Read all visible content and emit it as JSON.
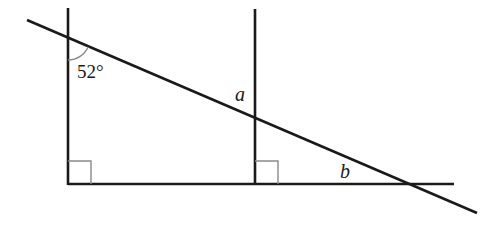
{
  "diagram": {
    "type": "geometry",
    "labels": {
      "given_angle": "52°",
      "angle_a": "a",
      "angle_b": "b"
    },
    "colors": {
      "line": "#1a1a1a",
      "right_angle_marker": "#8a8a8a",
      "angle_arc": "#8a8a8a",
      "background": "#ffffff"
    },
    "elements": {
      "horizontal_line": {
        "x1": 68,
        "y1": 184,
        "x2": 454,
        "y2": 184
      },
      "left_vertical": {
        "x1": 68,
        "y1": 8,
        "x2": 68,
        "y2": 184
      },
      "middle_vertical": {
        "x1": 255,
        "y1": 9,
        "x2": 255,
        "y2": 184
      },
      "transversal": {
        "x1": 27,
        "y1": 20,
        "x2": 477,
        "y2": 213
      },
      "right_angle_left": {
        "x": 68,
        "y": 161,
        "size": 23
      },
      "right_angle_middle": {
        "x": 255,
        "y": 161,
        "size": 23
      }
    }
  }
}
